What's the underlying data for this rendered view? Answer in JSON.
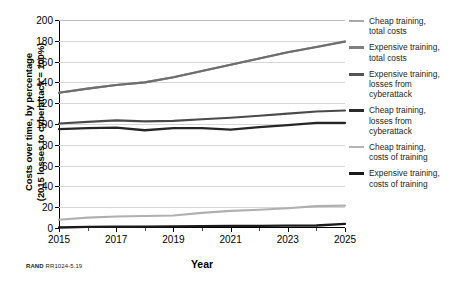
{
  "figure": {
    "y_axis_title_line1": "Costs over time, by percentage",
    "y_axis_title_line2": "(2015 losses to cyberattack = 100%)",
    "x_axis_title": "Year",
    "source_prefix": "RAND",
    "source_id": "RR1024-5.19"
  },
  "chart_data": {
    "type": "line",
    "title": "",
    "xlabel": "Year",
    "ylabel": "Costs over time, by percentage (2015 losses to cyberattack = 100%)",
    "xlim": [
      2015,
      2025
    ],
    "ylim": [
      0,
      200
    ],
    "ytick_labels": [
      "0",
      "20",
      "40",
      "60",
      "80",
      "100",
      "120",
      "140",
      "160",
      "180",
      "200"
    ],
    "yticks": [
      0,
      20,
      40,
      60,
      80,
      100,
      120,
      140,
      160,
      180,
      200
    ],
    "xtick_labels": [
      "2015",
      "2017",
      "2019",
      "2021",
      "2023",
      "2025"
    ],
    "xticks": [
      2015,
      2017,
      2019,
      2021,
      2023,
      2025
    ],
    "xticks_minor": [
      2016,
      2018,
      2020,
      2022,
      2024
    ],
    "grid": "horizontal",
    "legend_position": "right",
    "x": [
      2015,
      2016,
      2017,
      2018,
      2019,
      2020,
      2021,
      2022,
      2023,
      2024,
      2025
    ],
    "series": [
      {
        "name": "Cheap training, total costs",
        "color": "#8c8c8c",
        "width": 2.1,
        "values": [
          130,
          134,
          137.5,
          140,
          145,
          151,
          157,
          163,
          169,
          174,
          179.5
        ]
      },
      {
        "name": "Expensive training, total costs",
        "color": "#6e6e6e",
        "width": 2.1,
        "values": [
          130,
          134,
          137.5,
          140,
          145,
          151,
          157,
          163,
          169,
          174,
          179
        ]
      },
      {
        "name": "Expensive training, losses from cyberattack",
        "color": "#4a4a4a",
        "width": 2.1,
        "values": [
          100.5,
          102,
          103.5,
          102.5,
          103,
          104.5,
          106,
          108,
          110,
          112,
          113
        ]
      },
      {
        "name": "Cheap training, losses from cyberattack",
        "color": "#262626",
        "width": 2.3,
        "values": [
          95,
          96,
          96.5,
          94,
          96,
          96,
          94.5,
          97,
          99,
          101,
          101
        ]
      },
      {
        "name": "Cheap training, costs of training",
        "color": "#b0b0b0",
        "width": 2.1,
        "values": [
          8,
          10,
          11,
          11.5,
          12,
          14.5,
          16.5,
          17.5,
          19,
          21,
          21.5
        ]
      },
      {
        "name": "Expensive training, costs of training",
        "color": "#1a1a1a",
        "width": 2.3,
        "values": [
          0.5,
          1,
          1.2,
          1.4,
          1.6,
          1.8,
          2,
          2.1,
          2.2,
          2.4,
          4
        ]
      }
    ]
  },
  "legend": {
    "items": [
      {
        "label": "Cheap training,\ntotal costs",
        "color": "#a8a8a8",
        "width": 2
      },
      {
        "label": "Expensive training,\ntotal costs",
        "color": "#808080",
        "width": 2.4
      },
      {
        "label": "Expensive training,\nlosses from\ncyberattack",
        "color": "#545454",
        "width": 2.8
      },
      {
        "label": "Cheap training,\nlosses from\ncyberattack",
        "color": "#2b2b2b",
        "width": 3
      },
      {
        "label": "Cheap training,\ncosts of training",
        "color": "#b5b5b5",
        "width": 2
      },
      {
        "label": "Expensive training,\ncosts of training",
        "color": "#1a1a1a",
        "width": 3
      }
    ]
  }
}
